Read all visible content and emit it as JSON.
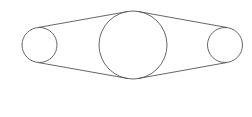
{
  "diagram": {
    "type": "belt-pulley",
    "stroke_color": "#555555",
    "background": "#ffffff",
    "pulleys": [
      {
        "name": "left-pulley",
        "cx": 39.5,
        "cy": 45,
        "r": 17.5
      },
      {
        "name": "center-pulley",
        "cx": 133,
        "cy": 45,
        "r": 34
      },
      {
        "name": "right-pulley",
        "cx": 225,
        "cy": 45,
        "r": 17.5
      }
    ],
    "belt_segments": [
      {
        "name": "belt-top-left",
        "x1": 38,
        "y1": 27.5,
        "x2": 128,
        "y2": 11.5
      },
      {
        "name": "belt-bottom-left",
        "x1": 38,
        "y1": 62.5,
        "x2": 128,
        "y2": 78.5
      },
      {
        "name": "belt-top-right",
        "x1": 138,
        "y1": 11.5,
        "x2": 227,
        "y2": 27.5
      },
      {
        "name": "belt-bottom-right",
        "x1": 138,
        "y1": 78.5,
        "x2": 227,
        "y2": 62.5
      }
    ]
  }
}
